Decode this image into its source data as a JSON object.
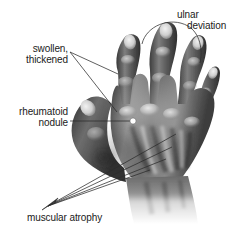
{
  "figure": {
    "kind": "medical-illustration",
    "background_color": "#ffffff",
    "text_color": "#1a1a1a",
    "leader_line_color": "#2b2b2b"
  },
  "labels": {
    "swollen_line1": "swollen,",
    "swollen_line2": "thickened",
    "nodule_line1": "rheumatoid",
    "nodule_line2": "nodule",
    "ulnar_line1": "ulnar",
    "ulnar_line2": "deviation",
    "atrophy": "muscular atrophy"
  },
  "annotations": [
    {
      "name": "swollen-thickened",
      "text": "swollen, thickened",
      "leader_origin": [
        70,
        52
      ],
      "leader_targets": [
        [
          118,
          74
        ],
        [
          117,
          112
        ]
      ],
      "marker": "none"
    },
    {
      "name": "rheumatoid-nodule",
      "text": "rheumatoid nodule",
      "leader_origin": [
        70,
        121
      ],
      "leader_targets": [
        [
          132,
          121
        ]
      ],
      "marker": "white-dot"
    },
    {
      "name": "ulnar-deviation",
      "text": "ulnar deviation",
      "marker": "curved-arc",
      "arc_start": [
        142,
        42
      ],
      "arc_end": [
        200,
        63
      ]
    },
    {
      "name": "muscular-atrophy",
      "text": "muscular atrophy",
      "leader_origin": [
        47,
        207
      ],
      "leader_targets": [
        [
          176,
          134
        ],
        [
          172,
          147
        ],
        [
          166,
          159
        ],
        [
          150,
          170
        ]
      ],
      "marker": "arrowhead"
    }
  ]
}
